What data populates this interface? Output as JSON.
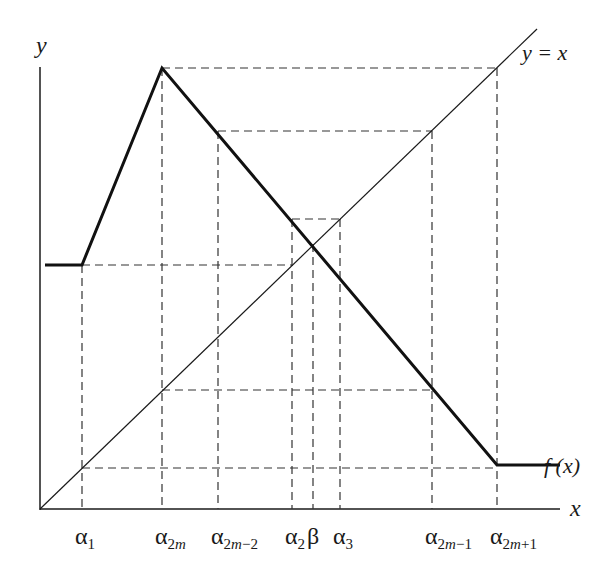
{
  "figure": {
    "axis_labels": {
      "y": "y",
      "x": "x"
    },
    "curve_labels": {
      "identity": "y = x",
      "function": "f (x)"
    },
    "x_ticks": [
      {
        "id": "alpha1",
        "base": "α",
        "sub": "1",
        "x": 82
      },
      {
        "id": "alpha2m",
        "base": "α",
        "sub": "2m",
        "x": 162
      },
      {
        "id": "alpha2m-2",
        "base": "α",
        "sub": "2m−2",
        "x": 218
      },
      {
        "id": "alpha2",
        "base": "α",
        "sub": "2",
        "x": 292
      },
      {
        "id": "beta",
        "base": "β",
        "sub": "",
        "x": 313
      },
      {
        "id": "alpha3",
        "base": "α",
        "sub": "3",
        "x": 340
      },
      {
        "id": "alpha2m-1",
        "base": "α",
        "sub": "2m−1",
        "x": 432
      },
      {
        "id": "alpha2m+1",
        "base": "α",
        "sub": "2m+1",
        "x": 497
      }
    ],
    "colors": {
      "ink": "#1a1a1a",
      "dash": "#333333",
      "background": "#ffffff"
    }
  },
  "chart_data": {
    "type": "line",
    "title": "",
    "xlabel": "x",
    "ylabel": "y",
    "series": [
      {
        "name": "f(x)",
        "style": "thick solid",
        "points_px": [
          [
            45,
            265
          ],
          [
            82,
            265
          ],
          [
            162,
            68
          ],
          [
            497,
            465
          ],
          [
            560,
            465
          ]
        ]
      },
      {
        "name": "y = x",
        "style": "thin solid",
        "points_px": [
          [
            40,
            509
          ],
          [
            537,
            29
          ]
        ]
      }
    ],
    "dashed_guides_px": {
      "horizontal": [
        [
          162,
          68,
          497,
          68
        ],
        [
          218,
          131,
          432,
          131
        ],
        [
          292,
          219,
          340,
          219
        ],
        [
          82,
          265,
          292,
          265
        ],
        [
          162,
          390,
          432,
          390
        ],
        [
          82,
          468,
          497,
          468
        ]
      ],
      "vertical": [
        [
          82,
          265,
          82,
          509
        ],
        [
          162,
          68,
          162,
          509
        ],
        [
          218,
          131,
          218,
          509
        ],
        [
          292,
          219,
          292,
          509
        ],
        [
          313,
          244,
          313,
          509
        ],
        [
          340,
          219,
          340,
          509
        ],
        [
          432,
          131,
          432,
          509
        ],
        [
          497,
          68,
          497,
          509
        ]
      ]
    },
    "annotations": [
      "y = x",
      "f (x)",
      "α1",
      "α2m",
      "α2m−2",
      "α2",
      "β",
      "α3",
      "α2m−1",
      "α2m+1"
    ]
  }
}
